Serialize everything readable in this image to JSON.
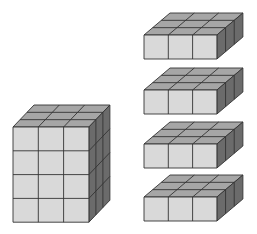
{
  "diagram": {
    "colors": {
      "front": "#d9d9d9",
      "top": "#a6a6a6",
      "side": "#6b6b6b",
      "stroke": "#333333",
      "background": "#ffffff"
    },
    "large_block": {
      "label": "3x3x4 cube stack",
      "cols": 3,
      "rows": 4,
      "depth": 3,
      "x": 13,
      "y": 127,
      "cell_w": 25.3,
      "cell_h": 23.8,
      "dx": 21,
      "dy": -22
    },
    "slabs": [
      {
        "label": "slab 1",
        "cols": 3,
        "rows": 1,
        "depth": 3,
        "x": 144,
        "y": 35,
        "cell_w": 24.3,
        "cell_h": 24,
        "dx": 26,
        "dy": -22
      },
      {
        "label": "slab 2",
        "cols": 3,
        "rows": 1,
        "depth": 3,
        "x": 144,
        "y": 90,
        "cell_w": 24.3,
        "cell_h": 24,
        "dx": 26,
        "dy": -22
      },
      {
        "label": "slab 3",
        "cols": 3,
        "rows": 1,
        "depth": 3,
        "x": 144,
        "y": 144,
        "cell_w": 24.3,
        "cell_h": 24,
        "dx": 26,
        "dy": -22
      },
      {
        "label": "slab 4",
        "cols": 3,
        "rows": 1,
        "depth": 3,
        "x": 144,
        "y": 197,
        "cell_w": 24.3,
        "cell_h": 24,
        "dx": 26,
        "dy": -22
      }
    ]
  }
}
